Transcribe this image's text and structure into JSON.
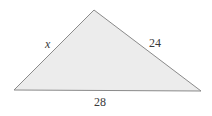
{
  "diagram": {
    "type": "triangle",
    "colors": {
      "fill": "#ececec",
      "stroke": "#8a8a8a",
      "text": "#3a3a3a"
    },
    "vertices": {
      "top": [
        94,
        10
      ],
      "left": [
        14,
        90
      ],
      "right": [
        201,
        91
      ]
    },
    "sides": {
      "left": {
        "label": "x"
      },
      "right": {
        "label": "24"
      },
      "bottom": {
        "label": "28"
      }
    }
  }
}
